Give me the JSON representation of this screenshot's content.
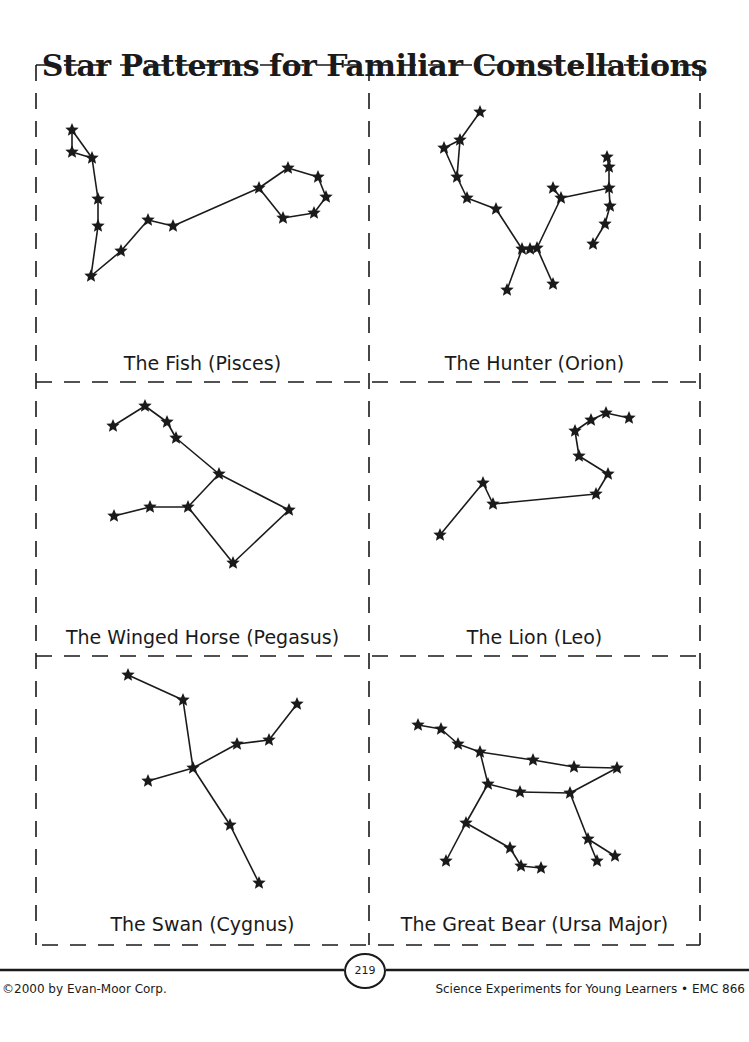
{
  "title": "Star Patterns for Familiar Constellations",
  "panels": [
    {
      "id": "pisces",
      "caption": "The Fish (Pisces)",
      "stars": [
        [
          72,
          130
        ],
        [
          72,
          152
        ],
        [
          92,
          158
        ],
        [
          98,
          199
        ],
        [
          98,
          226
        ],
        [
          91,
          276
        ],
        [
          121,
          251
        ],
        [
          148,
          220
        ],
        [
          173,
          226
        ],
        [
          259,
          188
        ],
        [
          288,
          168
        ],
        [
          318,
          177
        ],
        [
          326,
          197
        ],
        [
          314,
          213
        ],
        [
          283,
          218
        ]
      ],
      "edges": [
        [
          0,
          1
        ],
        [
          0,
          2
        ],
        [
          1,
          2
        ],
        [
          2,
          3
        ],
        [
          3,
          4
        ],
        [
          4,
          5
        ],
        [
          5,
          6
        ],
        [
          6,
          7
        ],
        [
          7,
          8
        ],
        [
          8,
          9
        ],
        [
          9,
          10
        ],
        [
          10,
          11
        ],
        [
          11,
          12
        ],
        [
          12,
          13
        ],
        [
          13,
          14
        ],
        [
          14,
          9
        ]
      ]
    },
    {
      "id": "orion",
      "caption": "The Hunter (Orion)",
      "stars": [
        [
          480,
          112
        ],
        [
          460,
          140
        ],
        [
          444,
          148
        ],
        [
          457,
          177
        ],
        [
          467,
          198
        ],
        [
          496,
          209
        ],
        [
          522,
          249
        ],
        [
          530,
          249
        ],
        [
          537,
          248
        ],
        [
          507,
          290
        ],
        [
          553,
          284
        ],
        [
          561,
          198
        ],
        [
          553,
          188
        ],
        [
          607,
          157
        ],
        [
          609,
          167
        ],
        [
          609,
          188
        ],
        [
          610,
          206
        ],
        [
          605,
          224
        ],
        [
          593,
          244
        ]
      ],
      "edges": [
        [
          0,
          1
        ],
        [
          1,
          2
        ],
        [
          2,
          3
        ],
        [
          1,
          3
        ],
        [
          3,
          4
        ],
        [
          4,
          5
        ],
        [
          5,
          6
        ],
        [
          6,
          7
        ],
        [
          7,
          8
        ],
        [
          6,
          9
        ],
        [
          8,
          10
        ],
        [
          8,
          11
        ],
        [
          11,
          12
        ],
        [
          11,
          15
        ],
        [
          13,
          14
        ],
        [
          14,
          15
        ],
        [
          15,
          16
        ],
        [
          16,
          17
        ],
        [
          17,
          18
        ]
      ]
    },
    {
      "id": "pegasus",
      "caption": "The Winged Horse (Pegasus)",
      "stars": [
        [
          113,
          426
        ],
        [
          145,
          406
        ],
        [
          167,
          422
        ],
        [
          176,
          438
        ],
        [
          219,
          474
        ],
        [
          188,
          507
        ],
        [
          150,
          507
        ],
        [
          114,
          516
        ],
        [
          289,
          510
        ],
        [
          233,
          563
        ]
      ],
      "edges": [
        [
          0,
          1
        ],
        [
          1,
          2
        ],
        [
          2,
          3
        ],
        [
          3,
          4
        ],
        [
          4,
          5
        ],
        [
          5,
          6
        ],
        [
          6,
          7
        ],
        [
          4,
          8
        ],
        [
          5,
          9
        ],
        [
          9,
          8
        ]
      ]
    },
    {
      "id": "leo",
      "caption": "The Lion (Leo)",
      "stars": [
        [
          440,
          535
        ],
        [
          483,
          483
        ],
        [
          493,
          504
        ],
        [
          596,
          494
        ],
        [
          608,
          474
        ],
        [
          579,
          456
        ],
        [
          575,
          431
        ],
        [
          591,
          420
        ],
        [
          606,
          413
        ],
        [
          629,
          418
        ]
      ],
      "edges": [
        [
          0,
          1
        ],
        [
          1,
          2
        ],
        [
          2,
          3
        ],
        [
          3,
          4
        ],
        [
          4,
          5
        ],
        [
          5,
          6
        ],
        [
          6,
          7
        ],
        [
          7,
          8
        ],
        [
          8,
          9
        ]
      ]
    },
    {
      "id": "cygnus",
      "caption": "The Swan (Cygnus)",
      "stars": [
        [
          128,
          675
        ],
        [
          183,
          700
        ],
        [
          193,
          768
        ],
        [
          148,
          781
        ],
        [
          237,
          744
        ],
        [
          269,
          740
        ],
        [
          297,
          704
        ],
        [
          230,
          825
        ],
        [
          259,
          883
        ]
      ],
      "edges": [
        [
          0,
          1
        ],
        [
          1,
          2
        ],
        [
          2,
          3
        ],
        [
          2,
          4
        ],
        [
          4,
          5
        ],
        [
          5,
          6
        ],
        [
          2,
          7
        ],
        [
          7,
          8
        ]
      ]
    },
    {
      "id": "ursa-major",
      "caption": "The Great Bear (Ursa Major)",
      "stars": [
        [
          418,
          725
        ],
        [
          441,
          729
        ],
        [
          458,
          744
        ],
        [
          480,
          752
        ],
        [
          533,
          760
        ],
        [
          574,
          767
        ],
        [
          617,
          768
        ],
        [
          488,
          784
        ],
        [
          520,
          792
        ],
        [
          570,
          793
        ],
        [
          466,
          823
        ],
        [
          446,
          861
        ],
        [
          510,
          848
        ],
        [
          521,
          866
        ],
        [
          541,
          868
        ],
        [
          588,
          839
        ],
        [
          597,
          861
        ],
        [
          615,
          856
        ]
      ],
      "edges": [
        [
          0,
          1
        ],
        [
          1,
          2
        ],
        [
          2,
          3
        ],
        [
          3,
          4
        ],
        [
          4,
          5
        ],
        [
          5,
          6
        ],
        [
          3,
          7
        ],
        [
          7,
          8
        ],
        [
          8,
          9
        ],
        [
          9,
          6
        ],
        [
          7,
          10
        ],
        [
          10,
          11
        ],
        [
          10,
          12
        ],
        [
          12,
          13
        ],
        [
          13,
          14
        ],
        [
          9,
          15
        ],
        [
          15,
          16
        ],
        [
          15,
          17
        ]
      ]
    }
  ],
  "footer": {
    "copyright": "©2000 by Evan-Moor Corp.",
    "page_number": "219",
    "book": "Science Experiments for Young Learners • EMC 866"
  }
}
